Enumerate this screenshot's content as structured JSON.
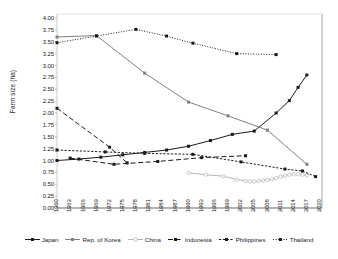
{
  "chart_data": {
    "type": "line",
    "title": "",
    "xlabel": "",
    "ylabel": "Farm size (ha)",
    "ylim": [
      0.0,
      4.0
    ],
    "ytick_step": 0.25,
    "xlim": [
      1960,
      2020
    ],
    "xtick_step": 3,
    "grid": false,
    "legend_position": "bottom",
    "yticks": [
      "4.00",
      "3.75",
      "3.50",
      "3.25",
      "3.00",
      "2.75",
      "2.50",
      "2.25",
      "2.00",
      "1.75",
      "1.50",
      "1.25",
      "1.00",
      "0.75",
      "0.50",
      "0.25",
      "0.00"
    ],
    "xticks": [
      "1960",
      "1963",
      "1966",
      "1969",
      "1972",
      "1975",
      "1978",
      "1981",
      "1984",
      "1987",
      "1990",
      "1993",
      "1996",
      "1999",
      "2002",
      "2005",
      "2008",
      "2011",
      "2014",
      "2017",
      "2020"
    ],
    "series": [
      {
        "name": "Japan",
        "color": "#1a1a1a",
        "style": "solid",
        "marker": "square-filled",
        "points": [
          [
            1960,
            1.0
          ],
          [
            1965,
            1.03
          ],
          [
            1970,
            1.07
          ],
          [
            1975,
            1.12
          ],
          [
            1980,
            1.17
          ],
          [
            1985,
            1.22
          ],
          [
            1990,
            1.3
          ],
          [
            1995,
            1.42
          ],
          [
            2000,
            1.55
          ],
          [
            2005,
            1.62
          ],
          [
            2010,
            2.0
          ],
          [
            2013,
            2.26
          ],
          [
            2015,
            2.54
          ],
          [
            2017,
            2.8
          ]
        ]
      },
      {
        "name": "Rep. of Korea",
        "color": "#808080",
        "style": "solid",
        "marker": "square-filled",
        "points": [
          [
            1960,
            3.6
          ],
          [
            1969,
            3.63
          ],
          [
            1980,
            2.84
          ],
          [
            1990,
            2.23
          ],
          [
            1999,
            1.94
          ],
          [
            2008,
            1.64
          ],
          [
            2017,
            0.92
          ]
        ]
      },
      {
        "name": "China",
        "color": "#b3b3b3",
        "style": "solid",
        "marker": "circle-open",
        "points": [
          [
            1990,
            0.74
          ],
          [
            1994,
            0.7
          ],
          [
            1998,
            0.67
          ],
          [
            2001,
            0.6
          ],
          [
            2003,
            0.57
          ],
          [
            2004,
            0.56
          ],
          [
            2005,
            0.56
          ],
          [
            2006,
            0.57
          ],
          [
            2007,
            0.58
          ],
          [
            2008,
            0.59
          ],
          [
            2009,
            0.61
          ],
          [
            2010,
            0.63
          ],
          [
            2011,
            0.66
          ],
          [
            2012,
            0.68
          ],
          [
            2013,
            0.7
          ],
          [
            2014,
            0.71
          ],
          [
            2015,
            0.71
          ],
          [
            2016,
            0.7
          ],
          [
            2017,
            0.69
          ]
        ]
      },
      {
        "name": "Indonesia",
        "color": "#1a1a1a",
        "style": "long-dash",
        "marker": "square-filled",
        "points": [
          [
            1963,
            1.05
          ],
          [
            1973,
            0.92
          ],
          [
            1983,
            0.98
          ],
          [
            1993,
            1.06
          ],
          [
            2003,
            1.1
          ]
        ]
      },
      {
        "name": "Philippines",
        "color": "#1a1a1a",
        "style": "short-dash",
        "marker": "square-filled",
        "points": [
          [
            1960,
            1.22
          ],
          [
            1971,
            1.18
          ],
          [
            1980,
            1.15
          ],
          [
            1991,
            1.13
          ],
          [
            2002,
            0.97
          ],
          [
            2012,
            0.82
          ],
          [
            2016,
            0.78
          ],
          [
            2019,
            0.66
          ]
        ]
      },
      {
        "name": "Thailand",
        "color": "#1a1a1a",
        "style": "dotted",
        "marker": "square-filled",
        "points": [
          [
            1960,
            3.48
          ],
          [
            1969,
            3.62
          ],
          [
            1978,
            3.76
          ],
          [
            1985,
            3.62
          ],
          [
            1991,
            3.47
          ],
          [
            2001,
            3.25
          ],
          [
            2010,
            3.23
          ]
        ]
      },
      {
        "name": "Thailand-early",
        "color": "#1a1a1a",
        "style": "long-dash",
        "marker": "square-filled",
        "points": [
          [
            1960,
            2.1
          ],
          [
            1972,
            1.28
          ],
          [
            1976,
            0.95
          ]
        ]
      }
    ]
  },
  "legend": {
    "items": [
      {
        "label": "Japan"
      },
      {
        "label": "Rep. of Korea"
      },
      {
        "label": "China"
      },
      {
        "label": "Indonesia"
      },
      {
        "label": "Philippines"
      },
      {
        "label": "Thailand"
      }
    ]
  }
}
